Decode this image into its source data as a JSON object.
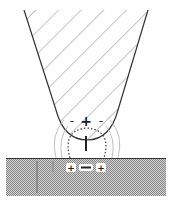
{
  "diagram": {
    "tip": {
      "top_left": [
        24,
        10
      ],
      "top_right": [
        148,
        10
      ],
      "apex": [
        87,
        140
      ],
      "fill_pattern": "diagonal-hatch",
      "charges": [
        {
          "symbol": "-",
          "x": 72,
          "y": 121
        },
        {
          "symbol": "+",
          "x": 86,
          "y": 121
        },
        {
          "symbol": "-",
          "x": 101,
          "y": 121
        }
      ]
    },
    "dipole": {
      "symbol": "|",
      "x": 86,
      "y": 143
    },
    "surface": {
      "y": 159,
      "charges": [
        {
          "symbol": "+",
          "x": 71,
          "y": 168
        },
        {
          "symbol": "−",
          "x": 86,
          "y": 168
        },
        {
          "symbol": "+",
          "x": 100,
          "y": 168
        }
      ]
    },
    "colors": {
      "outline": "#333333",
      "hatch": "#999999",
      "field_line": "#aaaaaa",
      "dotted_loop": "#444444",
      "substrate": "#bdbdbd"
    }
  }
}
